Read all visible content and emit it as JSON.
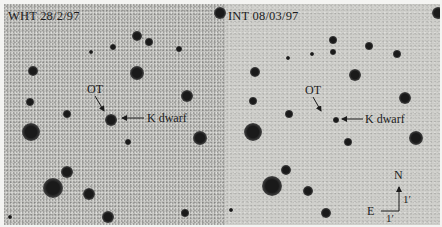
{
  "panels": [
    {
      "id": "left",
      "title": "WHT 28/2/97",
      "ot_label": "OT",
      "kdwarf_label": "K dwarf",
      "stars": [
        {
          "x": 133,
          "y": 32,
          "r": 5
        },
        {
          "x": 145,
          "y": 38,
          "r": 4
        },
        {
          "x": 109,
          "y": 43,
          "r": 3
        },
        {
          "x": 175,
          "y": 45,
          "r": 3
        },
        {
          "x": 87,
          "y": 48,
          "r": 2
        },
        {
          "x": 29,
          "y": 67,
          "r": 5
        },
        {
          "x": 133,
          "y": 69,
          "r": 7
        },
        {
          "x": 183,
          "y": 92,
          "r": 6
        },
        {
          "x": 26,
          "y": 98,
          "r": 4
        },
        {
          "x": 63,
          "y": 110,
          "r": 4
        },
        {
          "x": 107,
          "y": 116,
          "r": 6
        },
        {
          "x": 27,
          "y": 128,
          "r": 9
        },
        {
          "x": 196,
          "y": 134,
          "r": 7
        },
        {
          "x": 124,
          "y": 138,
          "r": 3
        },
        {
          "x": 63,
          "y": 168,
          "r": 6
        },
        {
          "x": 49,
          "y": 184,
          "r": 10
        },
        {
          "x": 85,
          "y": 190,
          "r": 6
        },
        {
          "x": 104,
          "y": 213,
          "r": 6
        },
        {
          "x": 181,
          "y": 209,
          "r": 4
        },
        {
          "x": 6,
          "y": 213,
          "r": 2
        },
        {
          "x": 216,
          "y": 9,
          "r": 6
        }
      ]
    },
    {
      "id": "right",
      "title": "INT 08/03/97",
      "ot_label": "OT",
      "kdwarf_label": "K dwarf",
      "stars": [
        {
          "x": 107,
          "y": 36,
          "r": 4
        },
        {
          "x": 107,
          "y": 48,
          "r": 3
        },
        {
          "x": 143,
          "y": 42,
          "r": 4
        },
        {
          "x": 171,
          "y": 50,
          "r": 4
        },
        {
          "x": 86,
          "y": 50,
          "r": 2
        },
        {
          "x": 62,
          "y": 54,
          "r": 2
        },
        {
          "x": 29,
          "y": 68,
          "r": 5
        },
        {
          "x": 129,
          "y": 71,
          "r": 6
        },
        {
          "x": 179,
          "y": 94,
          "r": 6
        },
        {
          "x": 27,
          "y": 97,
          "r": 4
        },
        {
          "x": 63,
          "y": 110,
          "r": 4
        },
        {
          "x": 110,
          "y": 116,
          "r": 3
        },
        {
          "x": 27,
          "y": 128,
          "r": 9
        },
        {
          "x": 190,
          "y": 134,
          "r": 7
        },
        {
          "x": 122,
          "y": 138,
          "r": 4
        },
        {
          "x": 60,
          "y": 166,
          "r": 5
        },
        {
          "x": 46,
          "y": 182,
          "r": 10
        },
        {
          "x": 82,
          "y": 187,
          "r": 5
        },
        {
          "x": 100,
          "y": 209,
          "r": 5
        },
        {
          "x": 5,
          "y": 206,
          "r": 2
        },
        {
          "x": 212,
          "y": 9,
          "r": 6
        }
      ]
    }
  ],
  "compass": {
    "north_label": "N",
    "east_label": "E",
    "scale_vertical_label": "1′",
    "scale_horizontal_label": "1′"
  }
}
